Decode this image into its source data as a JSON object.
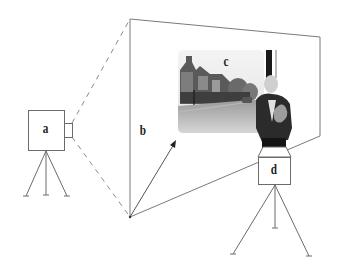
{
  "diagram": {
    "labels": {
      "camera": "a",
      "plane": "b",
      "photo": "c",
      "projector": "d"
    },
    "colors": {
      "line": "#6b6b6b",
      "dash": "#8a8a8a",
      "label": "#222222",
      "background": "#ffffff"
    }
  }
}
